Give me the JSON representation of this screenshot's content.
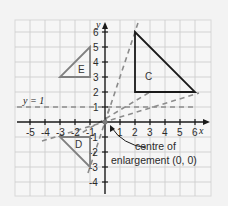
{
  "diagram": {
    "type": "coordinate-grid-enlargement",
    "axes": {
      "x_label": "x",
      "y_label": "y",
      "x_ticks": [
        "-5",
        "-4",
        "-3",
        "-2",
        "-1",
        "1",
        "2",
        "3",
        "4",
        "5",
        "6"
      ],
      "y_ticks": [
        "6",
        "5",
        "4",
        "3",
        "2",
        "1",
        "-1",
        "-2",
        "-3",
        "-4"
      ]
    },
    "line_label": "y = 1",
    "shapes": [
      {
        "name": "C",
        "vertices": [
          [
            2,
            6
          ],
          [
            2,
            2
          ],
          [
            6,
            2
          ]
        ],
        "color": "#1a1a1a"
      },
      {
        "name": "E",
        "vertices": [
          [
            -1,
            5
          ],
          [
            -1,
            3
          ],
          [
            -3,
            3
          ]
        ],
        "color": "#808080"
      },
      {
        "name": "D",
        "vertices": [
          [
            -1,
            -1
          ],
          [
            -3,
            -1
          ],
          [
            -1,
            -3
          ]
        ],
        "color": "#808080"
      }
    ],
    "annotation": {
      "line1": "centre of",
      "line2": "enlargement (0, 0)"
    },
    "colors": {
      "background": "#f3f3f3",
      "grid": "#c8c8c8",
      "axis": "#1a1a1a",
      "dashed": "#8c8c8c"
    }
  }
}
